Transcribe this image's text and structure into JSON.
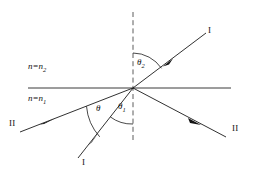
{
  "figure": {
    "type": "optics-ray-diagram",
    "background_color": "#ffffff",
    "line_color": "#1a1a1a",
    "interface_color": "#3a3a3a",
    "normal_color": "#4a4a4a"
  },
  "media": {
    "upper": {
      "label_prefix": "n",
      "equals": "=",
      "label_symbol": "n",
      "subscript": "2",
      "full": "n=n2"
    },
    "lower": {
      "label_prefix": "n",
      "equals": "=",
      "label_symbol": "n",
      "subscript": "1",
      "full": "n=n1"
    }
  },
  "angles": {
    "theta2": {
      "symbol": "θ",
      "subscript": "2",
      "region": "upper-between-normal-and-upper-right-ray"
    },
    "theta1": {
      "symbol": "θ",
      "subscript": "1",
      "region": "lower-between-bottom-ray-and-normal"
    },
    "theta": {
      "symbol": "θ",
      "subscript": "",
      "region": "lower-between-left-ray-and-bottom-ray"
    }
  },
  "ray_labels": {
    "upper_right": "I",
    "lower_left_bottom": "I",
    "left": "II",
    "right": "II"
  },
  "geometry": {
    "origin": {
      "x": 133,
      "y": 88
    },
    "interface": {
      "x1": 28,
      "y1": 88,
      "x2": 231,
      "y2": 88
    },
    "normal": {
      "x1": 133,
      "y1": 12,
      "x2": 133,
      "y2": 141
    },
    "rays": [
      {
        "name": "ray-I-upper-right",
        "x1": 133,
        "y1": 88,
        "x2": 206,
        "y2": 33,
        "arrow_at": {
          "x": 167,
          "y": 62
        },
        "arrow_dir": "toward-origin"
      },
      {
        "name": "ray-I-lower-left",
        "x1": 133,
        "y1": 88,
        "x2": 78,
        "y2": 158,
        "arrow_at": {
          "x": 94,
          "y": 138
        },
        "arrow_dir": "toward-origin"
      },
      {
        "name": "ray-II-left",
        "x1": 133,
        "y1": 88,
        "x2": 20,
        "y2": 132,
        "arrow_at": {
          "x": 47,
          "y": 121
        },
        "arrow_dir": "toward-origin"
      },
      {
        "name": "ray-II-right",
        "x1": 133,
        "y1": 88,
        "x2": 226,
        "y2": 137,
        "arrow_at": {
          "x": 194,
          "y": 121
        },
        "arrow_dir": "away-from-origin"
      }
    ]
  }
}
